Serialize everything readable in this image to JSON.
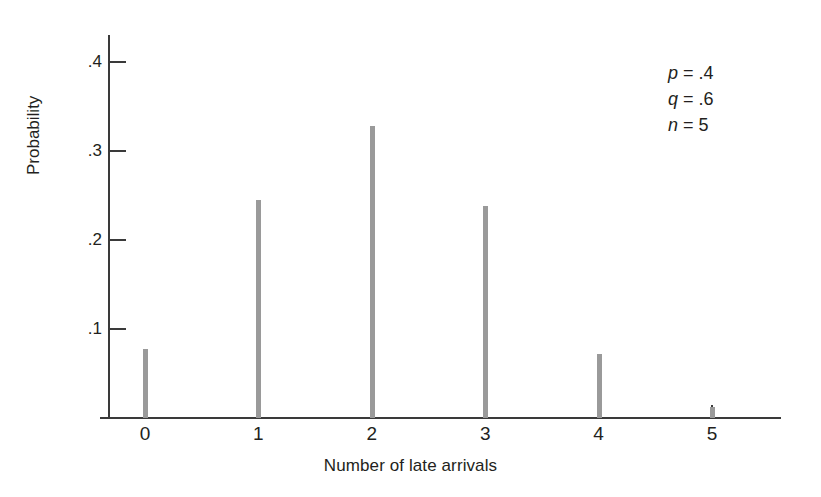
{
  "figure": {
    "background": "#ffffff",
    "axis_color": "#3a3a3a",
    "spike_color": "#9a9a9a",
    "text_color": "#231f20"
  },
  "chart_data": {
    "type": "bar",
    "title": "",
    "subtitle": "",
    "xlabel": "Number of late arrivals",
    "ylabel": "Probability",
    "categories": [
      "0",
      "1",
      "2",
      "3",
      "4",
      "5"
    ],
    "values": [
      0.078,
      0.245,
      0.328,
      0.238,
      0.072,
      0.012
    ],
    "xlim": [
      -0.4,
      5.6
    ],
    "ylim": [
      0,
      0.44
    ],
    "yticks": [
      0.1,
      0.2,
      0.3,
      0.4
    ],
    "ytick_labels": [
      ".1",
      ".2",
      ".3",
      ".4"
    ],
    "xticks": [
      0,
      1,
      2,
      3,
      4,
      5
    ],
    "xtick_labels": [
      "0",
      "1",
      "2",
      "3",
      "4",
      "5"
    ],
    "grid": false,
    "legend": "none",
    "annotations": [
      {
        "symbol": "p",
        "equals": "=",
        "value": ".4"
      },
      {
        "symbol": "q",
        "equals": "=",
        "value": ".6"
      },
      {
        "symbol": "n",
        "equals": "=",
        "value": "5"
      }
    ]
  }
}
